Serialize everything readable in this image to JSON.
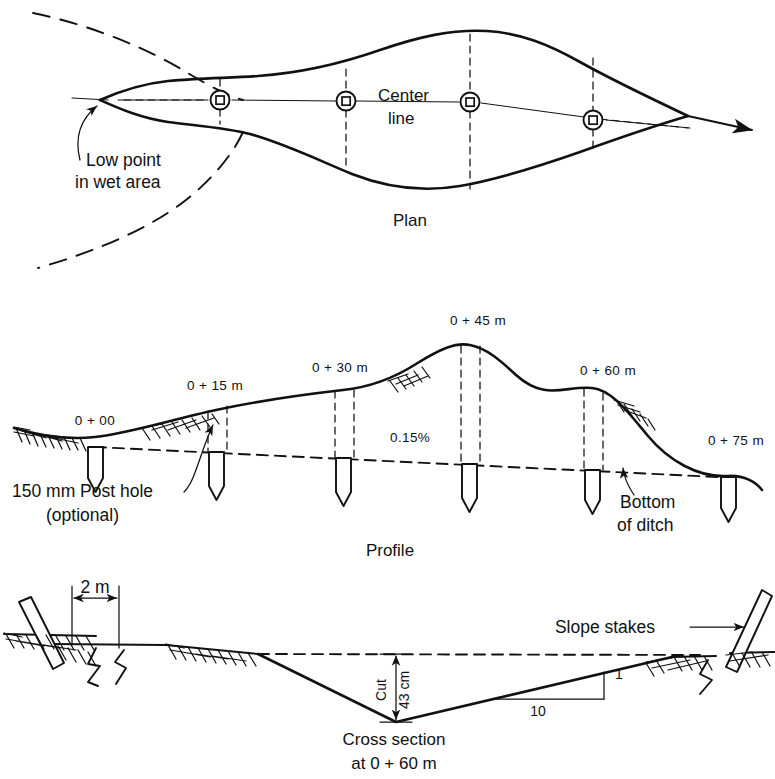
{
  "figure": {
    "ink_color": "#111111",
    "paper_color": "#ffffff"
  },
  "plan": {
    "caption": "Plan",
    "centerline_label_line1": "Center",
    "centerline_label_line2": "line",
    "low_point_note_line1": "Low point",
    "low_point_note_line2": "in wet area",
    "station_symbol_name": "survey-monument-symbol",
    "station_count": 4
  },
  "profile": {
    "caption": "Profile",
    "grade_label": "0.15%",
    "post_hole_note_line1": "150 mm Post hole",
    "post_hole_note_line2": "(optional)",
    "ditch_bottom_note_line1": "Bottom",
    "ditch_bottom_note_line2": "of ditch",
    "stations": [
      {
        "label": "0 + 00",
        "x": 95,
        "ground_y": 437,
        "ditch_y": 447
      },
      {
        "label": "0 + 15 m",
        "x": 216,
        "ground_y": 410,
        "ditch_y": 452
      },
      {
        "label": "0 + 30 m",
        "x": 343,
        "ground_y": 390,
        "ditch_y": 458
      },
      {
        "label": "0 + 45 m",
        "x": 470,
        "ground_y": 345,
        "ditch_y": 464
      },
      {
        "label": "0 + 60 m",
        "x": 592,
        "ground_y": 388,
        "ditch_y": 470
      },
      {
        "label": "0 + 75 m",
        "x": 728,
        "ground_y": 476,
        "ditch_y": 477
      }
    ]
  },
  "cross_section": {
    "caption_line1": "Cross section",
    "caption_line2": "at 0 + 60 m",
    "width_dimension": "2  m",
    "cut_label": "Cut",
    "cut_depth": "43 cm",
    "slope_run": "10",
    "slope_rise": "1",
    "slope_stakes_label": "Slope stakes"
  }
}
